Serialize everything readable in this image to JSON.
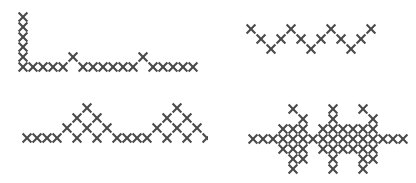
{
  "canvas": {
    "width": 416,
    "height": 183,
    "background_color": "#ffffff"
  },
  "stitch": {
    "cell": 10,
    "stroke_color": "#4a4a4a",
    "stroke_width": 2.1,
    "inset": 0.6,
    "glyph": "cross-stitch-x"
  },
  "patterns": [
    {
      "id": "top-left",
      "name": "corner-border-with-peaks",
      "label": "Corner border with raised peaks",
      "origin_x": 18,
      "origin_y": 12,
      "cells": [
        [
          0,
          0
        ],
        [
          0,
          1
        ],
        [
          0,
          2
        ],
        [
          0,
          3
        ],
        [
          0,
          4
        ],
        [
          0,
          5
        ],
        [
          1,
          5
        ],
        [
          2,
          5
        ],
        [
          3,
          5
        ],
        [
          4,
          5
        ],
        [
          5,
          4
        ],
        [
          6,
          5
        ],
        [
          7,
          5
        ],
        [
          8,
          5
        ],
        [
          9,
          5
        ],
        [
          10,
          5
        ],
        [
          11,
          5
        ],
        [
          12,
          4
        ],
        [
          13,
          5
        ],
        [
          14,
          5
        ],
        [
          15,
          5
        ],
        [
          16,
          5
        ],
        [
          17,
          5
        ]
      ]
    },
    {
      "id": "top-right",
      "name": "open-zigzag-border",
      "label": "Open zigzag of separated stitches",
      "origin_x": 246,
      "origin_y": 24,
      "cells": [
        [
          0,
          0
        ],
        [
          1,
          1
        ],
        [
          2,
          2
        ],
        [
          3,
          1
        ],
        [
          4,
          0
        ],
        [
          5,
          1
        ],
        [
          6,
          2
        ],
        [
          7,
          1
        ],
        [
          8,
          0
        ],
        [
          9,
          1
        ],
        [
          10,
          2
        ],
        [
          11,
          1
        ],
        [
          12,
          0
        ]
      ]
    },
    {
      "id": "bottom-left",
      "name": "diamond-peak-border",
      "label": "Baseline band with diamond peaks",
      "origin_x": 22,
      "origin_y": 103,
      "cells": [
        [
          0,
          3
        ],
        [
          1,
          3
        ],
        [
          2,
          3
        ],
        [
          3,
          3
        ],
        [
          4,
          2
        ],
        [
          5,
          1
        ],
        [
          6,
          0
        ],
        [
          7,
          1
        ],
        [
          8,
          2
        ],
        [
          5,
          3
        ],
        [
          6,
          2
        ],
        [
          7,
          3
        ],
        [
          9,
          3
        ],
        [
          10,
          3
        ],
        [
          11,
          3
        ],
        [
          12,
          3
        ],
        [
          13,
          2
        ],
        [
          14,
          1
        ],
        [
          15,
          0
        ],
        [
          16,
          1
        ],
        [
          17,
          2
        ],
        [
          14,
          3
        ],
        [
          15,
          2
        ],
        [
          16,
          3
        ],
        [
          18,
          3
        ],
        [
          19,
          3
        ],
        [
          20,
          3
        ]
      ]
    },
    {
      "id": "bottom-right",
      "name": "cross-motif-border",
      "label": "Band with vertical cross motifs",
      "origin_x": 248,
      "origin_y": 104,
      "cells": [
        [
          0,
          3
        ],
        [
          1,
          3
        ],
        [
          2,
          3
        ],
        [
          3,
          3
        ],
        [
          4,
          3
        ],
        [
          5,
          3
        ],
        [
          6,
          3
        ],
        [
          7,
          3
        ],
        [
          8,
          3
        ],
        [
          9,
          3
        ],
        [
          10,
          3
        ],
        [
          11,
          3
        ],
        [
          12,
          3
        ],
        [
          13,
          3
        ],
        [
          14,
          3
        ],
        [
          15,
          3
        ],
        [
          4,
          0
        ],
        [
          5,
          1
        ],
        [
          4,
          2
        ],
        [
          3,
          2
        ],
        [
          5,
          2
        ],
        [
          4,
          4
        ],
        [
          3,
          4
        ],
        [
          5,
          4
        ],
        [
          4,
          5
        ],
        [
          5,
          5
        ],
        [
          4,
          6
        ],
        [
          8,
          0
        ],
        [
          8,
          1
        ],
        [
          7,
          2
        ],
        [
          8,
          2
        ],
        [
          9,
          2
        ],
        [
          7,
          4
        ],
        [
          8,
          4
        ],
        [
          9,
          4
        ],
        [
          8,
          5
        ],
        [
          8,
          6
        ],
        [
          11,
          0
        ],
        [
          12,
          1
        ],
        [
          11,
          2
        ],
        [
          12,
          2
        ],
        [
          10,
          2
        ],
        [
          11,
          4
        ],
        [
          12,
          4
        ],
        [
          10,
          4
        ],
        [
          11,
          5
        ],
        [
          12,
          5
        ],
        [
          11,
          6
        ]
      ]
    }
  ]
}
